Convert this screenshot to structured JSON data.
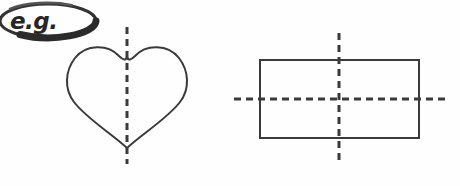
{
  "page": {
    "background_color": "#fefefe",
    "ink_color": "#3a3a3a",
    "width": 460,
    "height": 186
  },
  "callout": {
    "name": "eg-badge",
    "label": "e.g.",
    "shape": "ellipse",
    "stroke_color": "#333333",
    "center_x": 48,
    "center_y": 21,
    "radius_x": 48,
    "radius_y": 17
  },
  "figures": [
    {
      "name": "heart-figure",
      "shape": "heart",
      "shape_label": "heart",
      "stroke_color": "#3a3a3a",
      "stroke_width": 2,
      "fill": "none",
      "bounds": {
        "x": 67,
        "y": 44,
        "width": 122,
        "height": 105
      },
      "tip_x": 127,
      "tip_y": 148,
      "notch_y": 57,
      "symmetry_lines": [
        {
          "name": "vertical-symmetry-line",
          "orientation": "vertical",
          "x1": 127,
          "y1": 27,
          "x2": 127,
          "y2": 164,
          "dash": "7 5",
          "stroke_width": 3,
          "color": "#3a3a3a"
        }
      ],
      "symmetry_line_count": 1
    },
    {
      "name": "rectangle-figure",
      "shape": "rectangle",
      "shape_label": "rectangle",
      "stroke_color": "#3a3a3a",
      "stroke_width": 2,
      "fill": "none",
      "bounds": {
        "x": 260,
        "y": 60,
        "width": 159,
        "height": 78
      },
      "symmetry_lines": [
        {
          "name": "vertical-symmetry-line",
          "orientation": "vertical",
          "x1": 339,
          "y1": 33,
          "x2": 339,
          "y2": 165,
          "dash": "7 5",
          "stroke_width": 3,
          "color": "#3a3a3a"
        },
        {
          "name": "horizontal-symmetry-line",
          "orientation": "horizontal",
          "x1": 234,
          "y1": 99,
          "x2": 446,
          "y2": 99,
          "dash": "7 5",
          "stroke_width": 3,
          "color": "#3a3a3a"
        }
      ],
      "symmetry_line_count": 2
    }
  ]
}
